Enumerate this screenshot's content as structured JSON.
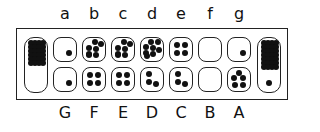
{
  "diagram": {
    "type": "mancala-board",
    "top_labels": [
      "a",
      "b",
      "c",
      "d",
      "e",
      "f",
      "g"
    ],
    "bottom_labels": [
      "G",
      "F",
      "E",
      "D",
      "C",
      "B",
      "A"
    ],
    "top_row": [
      {
        "label": "a",
        "seeds": 1
      },
      {
        "label": "b",
        "seeds": 7
      },
      {
        "label": "c",
        "seeds": 7
      },
      {
        "label": "d",
        "seeds": 8
      },
      {
        "label": "e",
        "seeds": 4
      },
      {
        "label": "f",
        "seeds": 0
      },
      {
        "label": "g",
        "seeds": 1
      }
    ],
    "bottom_row": [
      {
        "label": "G",
        "seeds": 1
      },
      {
        "label": "F",
        "seeds": 4
      },
      {
        "label": "E",
        "seeds": 4
      },
      {
        "label": "D",
        "seeds": 3
      },
      {
        "label": "C",
        "seeds": 3
      },
      {
        "label": "B",
        "seeds": 0
      },
      {
        "label": "A",
        "seeds": 5
      }
    ],
    "stores": {
      "left": {
        "count": null,
        "description": "dense cluster of overlapping seeds in upper portion; individual seeds not countable"
      },
      "right": {
        "count": null,
        "description": "dense cluster of overlapping seeds in upper portion plus one separate seed near bottom; individual seeds not countable"
      }
    },
    "colors": {
      "seed": "#111111",
      "outline": "#222222",
      "background": "#ffffff"
    }
  }
}
